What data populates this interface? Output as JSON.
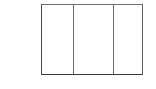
{
  "figure": {
    "name": "three-column-rectangle",
    "type": "line-drawing",
    "title": "",
    "caption": "",
    "background_color": "#ffffff",
    "stroke_color": "#555555",
    "fill_color": "#ffffff",
    "stroke_width_px": 1,
    "bounds": {
      "left_px": 41,
      "top_px": 4,
      "width_px": 102,
      "height_px": 71
    },
    "border_colors": {
      "top": "#6e6e6e",
      "right": "#5f5f5f",
      "bottom": "#3b3b3b",
      "left": "#4a4a4a"
    },
    "divider_color": "#6a6a6a",
    "divider_x_positions_px": [
      72,
      111
    ],
    "panel_count": 3,
    "panels": [
      {
        "index": 1,
        "label": "",
        "width_px": 31,
        "fill": "#ffffff"
      },
      {
        "index": 2,
        "label": "",
        "width_px": 39,
        "fill": "#ffffff"
      },
      {
        "index": 3,
        "label": "",
        "width_px": 31,
        "fill": "#ffffff"
      }
    ]
  },
  "canvas": {
    "width_px": 156,
    "height_px": 89,
    "background_color": "#ffffff"
  }
}
